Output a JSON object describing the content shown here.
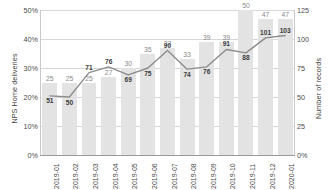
{
  "chart_data": {
    "type": "bar",
    "title": "",
    "categories": [
      "2019-01",
      "2019-02",
      "2019-03",
      "2019-04",
      "2019-05",
      "2019-06",
      "2019-07",
      "2019-08",
      "2019-09",
      "2019-10",
      "2019-11",
      "2019-12",
      "2020-01"
    ],
    "series": [
      {
        "name": "NPS Home deliveries",
        "chart_type": "bar",
        "axis": "left",
        "unit": "%",
        "color": "#e3e3e3",
        "values": [
          25,
          25,
          25,
          27,
          30,
          35,
          37,
          33,
          39,
          39,
          50,
          47,
          47
        ],
        "labels": [
          "25",
          "25",
          "25",
          "27",
          "30",
          "35",
          "37",
          "33",
          "39",
          "39",
          "50",
          "47",
          "47"
        ]
      },
      {
        "name": "Number of records",
        "chart_type": "line",
        "axis": "right",
        "color": "#8c8c8c",
        "values": [
          51,
          50,
          71,
          76,
          69,
          75,
          90,
          74,
          76,
          91,
          88,
          101,
          103
        ],
        "labels": [
          "51",
          "50",
          "71",
          "76",
          "69",
          "75",
          "90",
          "74",
          "76",
          "91",
          "88",
          "101",
          "103"
        ]
      }
    ],
    "xlabel": "",
    "ylabel": "NPS Home deliveries",
    "y2label": "Number of records",
    "ylim": [
      0,
      50
    ],
    "y2lim": [
      0,
      125
    ],
    "yticks": [
      "0%",
      "10%",
      "20%",
      "30%",
      "40%",
      "50%"
    ],
    "y2ticks": [
      "0%",
      "25",
      "50",
      "75",
      "100",
      "125"
    ],
    "grid": true,
    "legend": "none"
  },
  "axes": {
    "left_title": "NPS Home deliveries",
    "right_title": "Number of records"
  }
}
